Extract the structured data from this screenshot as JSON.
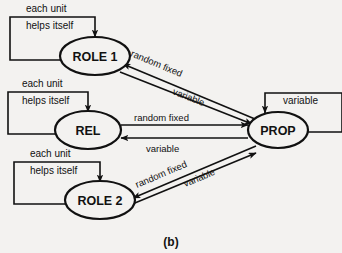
{
  "figure": {
    "caption": "(b)",
    "background_color": "#f3f2f0",
    "ink_color": "#111111"
  },
  "nodes": [
    {
      "id": "role1",
      "label": "ROLE 1",
      "cx": 95,
      "cy": 56
    },
    {
      "id": "rel",
      "label": "REL",
      "cx": 88,
      "cy": 130
    },
    {
      "id": "role2",
      "label": "ROLE 2",
      "cx": 100,
      "cy": 200
    },
    {
      "id": "prop",
      "label": "PROP",
      "cx": 278,
      "cy": 130
    }
  ],
  "self_loops": [
    {
      "node": "role1",
      "label_top": "each unit",
      "label_bottom": "helps itself"
    },
    {
      "node": "rel",
      "label_top": "each unit",
      "label_bottom": "helps itself"
    },
    {
      "node": "role2",
      "label_top": "each unit",
      "label_bottom": "helps itself"
    },
    {
      "node": "prop",
      "label_top": "",
      "label_bottom": "variable"
    }
  ],
  "edges": [
    {
      "from": "prop",
      "to": "role1",
      "label": "random fixed"
    },
    {
      "from": "role1",
      "to": "prop",
      "label": "variable"
    },
    {
      "from": "rel",
      "to": "prop",
      "label": "random fixed"
    },
    {
      "from": "prop",
      "to": "rel",
      "label": "variable"
    },
    {
      "from": "prop",
      "to": "role2",
      "label": "random fixed"
    },
    {
      "from": "role2",
      "to": "prop",
      "label": "variable"
    }
  ],
  "labels": {
    "each_unit": "each unit",
    "helps_itself": "helps itself",
    "random_fixed": "random fixed",
    "variable": "variable"
  }
}
